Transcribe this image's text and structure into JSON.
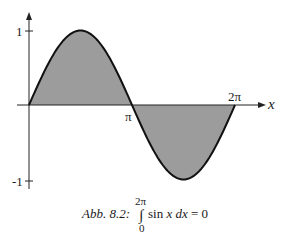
{
  "chart_data": {
    "type": "area",
    "title": "",
    "function": "sin x",
    "x_range": [
      0,
      6.2832
    ],
    "xlabel": "x",
    "ylabel": "",
    "x_ticks": [
      {
        "value": 3.1416,
        "label": "π"
      },
      {
        "value": 6.2832,
        "label": "2π"
      }
    ],
    "y_ticks": [
      {
        "value": 1,
        "label": "1"
      },
      {
        "value": -1,
        "label": "-1"
      }
    ],
    "ylim": [
      -1,
      1
    ],
    "x": [
      0,
      0.7854,
      1.5708,
      2.3562,
      3.1416,
      3.927,
      4.7124,
      5.4978,
      6.2832
    ],
    "values": [
      0,
      0.707,
      1,
      0.707,
      0,
      -0.707,
      -1,
      -0.707,
      0
    ],
    "shaded_region": "area between curve and x-axis from 0 to 2π",
    "grid": false,
    "legend": null,
    "caption": {
      "label": "Abb. 8.2:",
      "integral_upper": "2π",
      "integral_lower": "0",
      "integrand": "sin x dx = 0"
    }
  },
  "colors": {
    "curve": "#111111",
    "fill": "#9c9c9c",
    "axis": "#222222"
  }
}
